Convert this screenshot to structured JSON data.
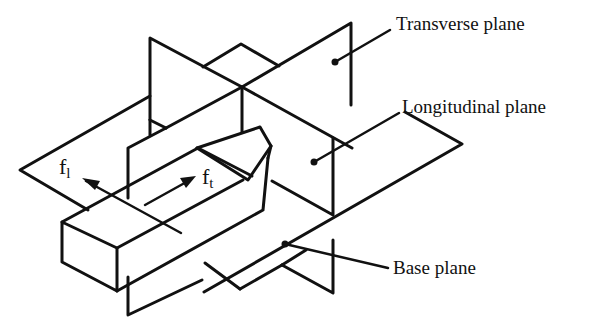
{
  "figure": {
    "type": "isometric tool-coordinate plane diagram",
    "stroke_color": "#111111",
    "background": "#ffffff"
  },
  "labels": {
    "transverse_plane": "Transverse plane",
    "longitudinal_plane": "Longitudinal plane",
    "base_plane": "Base plane"
  },
  "forces": {
    "fl": {
      "symbol": "f",
      "subscript": "l"
    },
    "ft": {
      "symbol": "f",
      "subscript": "t"
    }
  }
}
